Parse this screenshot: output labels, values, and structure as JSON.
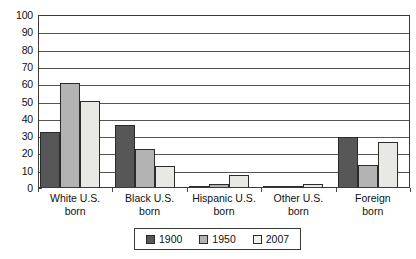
{
  "chart_data": {
    "type": "bar",
    "title": "",
    "xlabel": "",
    "ylabel": "",
    "ylim": [
      0,
      100
    ],
    "ytick_step": 10,
    "grid": true,
    "legend_position": "bottom",
    "categories": [
      "White U.S. born",
      "Black U.S. born",
      "Hispanic U.S. born",
      "Other U.S. born",
      "Foreign born"
    ],
    "category_lines": [
      [
        "White U.S.",
        "born"
      ],
      [
        "Black U.S.",
        "born"
      ],
      [
        "Hispanic U.S.",
        "born"
      ],
      [
        "Other U.S.",
        "born"
      ],
      [
        "Foreign",
        "born"
      ]
    ],
    "yticks": [
      100,
      90,
      80,
      70,
      60,
      50,
      40,
      30,
      20,
      10,
      0
    ],
    "series": [
      {
        "name": "1900",
        "color": "#575757",
        "values": [
          32,
          36,
          0.5,
          0.3,
          29
        ]
      },
      {
        "name": "1950",
        "color": "#b3b3b3",
        "values": [
          60,
          22,
          1.5,
          0.3,
          13
        ]
      },
      {
        "name": "2007",
        "color": "#e8e8e5",
        "values": [
          50,
          12,
          7,
          2,
          26
        ]
      }
    ]
  },
  "legend": {
    "items": [
      {
        "label": "1900"
      },
      {
        "label": "1950"
      },
      {
        "label": "2007"
      }
    ]
  }
}
